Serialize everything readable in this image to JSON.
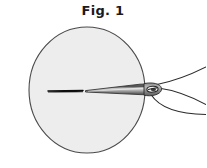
{
  "figure": {
    "caption": "Fig. 1",
    "caption_x": 103,
    "caption_y": 14,
    "background_color": "#ffffff"
  },
  "fabric": {
    "label": "fabric-circle",
    "shape": "circle",
    "center_x": 87,
    "center_y": 90,
    "radius_x": 58,
    "radius_y": 63,
    "fill_color": "#ededed",
    "stroke_color": "#4a4a4a",
    "stroke_width": 1.1
  },
  "stitch": {
    "label": "existing-stitch-line",
    "x1": 48,
    "y1": 91,
    "x2": 83,
    "y2": 91,
    "color": "#1c1c1c",
    "width": 2.2
  },
  "needle": {
    "label": "sewing-needle",
    "tip_x": 86,
    "tip_y": 91,
    "eye_x": 152,
    "eye_y": 89,
    "body_fill": "#8e8e8e",
    "body_highlight": "#d8d8d8",
    "body_shadow": "#5a5a5a",
    "outline_color": "#2e2e2e",
    "outline_width": 0.9,
    "eye_hole_fill": "#f4f4f4",
    "eye_hole_stroke": "#2b2b2b"
  },
  "thread": {
    "label": "thread-strands",
    "color": "#2b2b2b",
    "width": 1.1,
    "strands": [
      {
        "name": "upper-strand",
        "path": "M 156 85 C 172 82 188 76 206 68"
      },
      {
        "name": "lower-strand",
        "path": "M 152 95 C 160 108 176 114 206 114"
      },
      {
        "name": "loop-strand",
        "path": "M 158 88 C 176 90 190 96 206 104"
      }
    ]
  },
  "colors": {
    "ink": "#2b2b2b",
    "fabric_gray": "#ededed",
    "metal_gray": "#8e8e8e",
    "paper_white": "#ffffff"
  }
}
